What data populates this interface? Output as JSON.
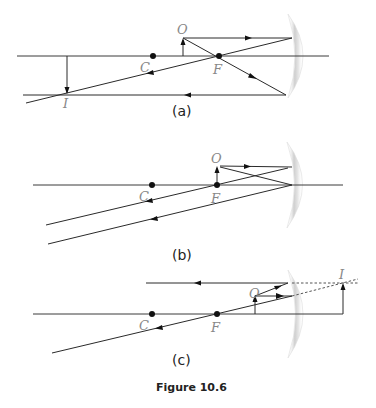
{
  "figure": {
    "caption": "Figure 10.6",
    "panels": [
      {
        "id": "a",
        "label": "(a)",
        "points": {
          "center_of_curvature": "C",
          "focus": "F",
          "object": "O",
          "image": "I"
        },
        "description": "Object beyond C; real, inverted image formed in front of concave mirror"
      },
      {
        "id": "b",
        "label": "(b)",
        "points": {
          "center_of_curvature": "C",
          "focus": "F",
          "object": "O"
        },
        "description": "Object at F; reflected rays are parallel, image at infinity"
      },
      {
        "id": "c",
        "label": "(c)",
        "points": {
          "center_of_curvature": "C",
          "focus": "F",
          "object": "O",
          "image": "I"
        },
        "description": "Object between F and mirror; virtual, upright image behind mirror"
      }
    ]
  },
  "colors": {
    "ray": "#2a2a2a",
    "label": "#888888",
    "mirror": "#d8d8d8"
  }
}
